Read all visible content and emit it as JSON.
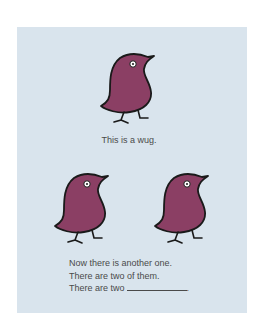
{
  "colors": {
    "panel_background": "#d9e4ed",
    "bird_body": "#8b3f64",
    "bird_outline": "#1a1a1a",
    "text": "#4a4a4a"
  },
  "figures": [
    {
      "name": "wug-1",
      "icon": "wug-bird-icon"
    },
    {
      "name": "wug-2",
      "icon": "wug-bird-icon"
    },
    {
      "name": "wug-3",
      "icon": "wug-bird-icon"
    }
  ],
  "captions": {
    "first": "This is a wug.",
    "second_lines": [
      "Now there is another one.",
      "There are two of them.",
      "There are two"
    ],
    "blank_terminator": "."
  }
}
